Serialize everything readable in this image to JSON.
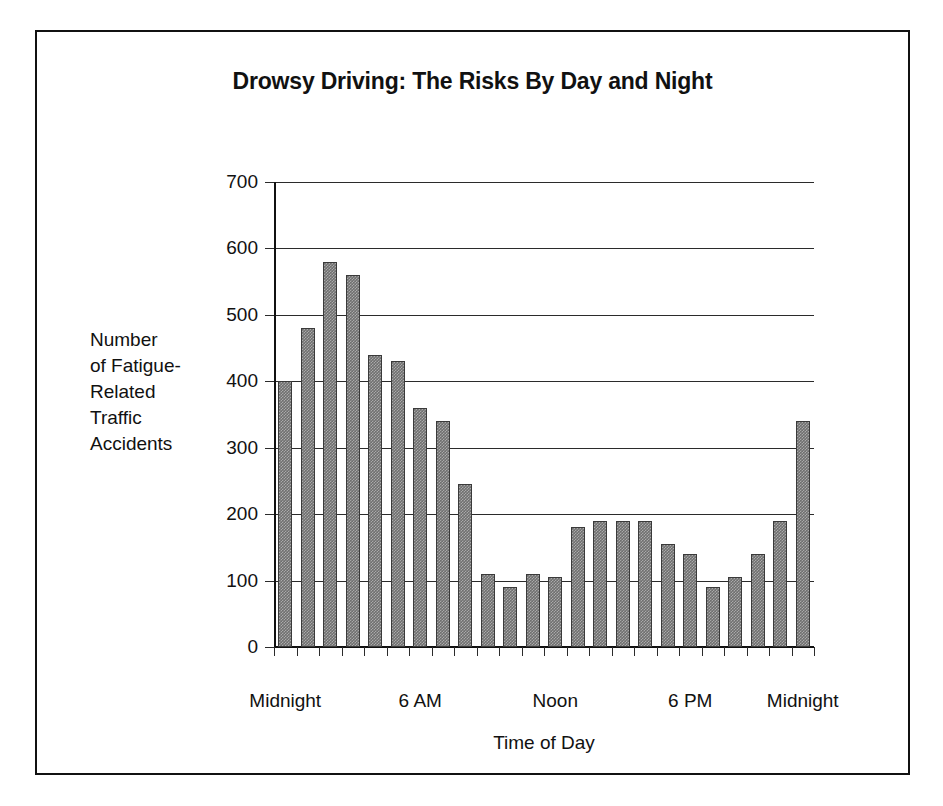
{
  "figure": {
    "title": "Drowsy Driving: The Risks By Day and Night",
    "frame_color": "#111111",
    "background": "#ffffff",
    "bar_color": "#6f6f6f",
    "bar_border_color": "#3a3a3a"
  },
  "chart_data": {
    "type": "bar",
    "title": "Drowsy Driving: The Risks By Day and Night",
    "xlabel": "Time of Day",
    "ylabel": "Number of Fatigue-Related Traffic Accidents",
    "ylabel_lines": [
      "Number",
      "of Fatigue-",
      "Related",
      "Traffic",
      "Accidents"
    ],
    "ylim": [
      0,
      700
    ],
    "ytick_values": [
      0,
      100,
      200,
      300,
      400,
      500,
      600,
      700
    ],
    "ytick_labels": [
      "0",
      "100",
      "200",
      "300",
      "400",
      "500",
      "600",
      "700"
    ],
    "grid": true,
    "legend": "none",
    "categories": [
      "12 AM",
      "1 AM",
      "2 AM",
      "3 AM",
      "4 AM",
      "5 AM",
      "6 AM",
      "7 AM",
      "8 AM",
      "9 AM",
      "10 AM",
      "11 AM",
      "12 PM",
      "1 PM",
      "2 PM",
      "3 PM",
      "4 PM",
      "5 PM",
      "6 PM",
      "7 PM",
      "8 PM",
      "9 PM",
      "10 PM",
      "11 PM"
    ],
    "values": [
      400,
      480,
      580,
      560,
      440,
      430,
      360,
      340,
      245,
      110,
      90,
      110,
      105,
      180,
      190,
      190,
      190,
      155,
      140,
      90,
      105,
      140,
      190,
      340
    ],
    "xtick_labels": [
      {
        "label": "Midnight",
        "index": 0
      },
      {
        "label": "6 AM",
        "index": 6
      },
      {
        "label": "Noon",
        "index": 12
      },
      {
        "label": "6 PM",
        "index": 18
      },
      {
        "label": "Midnight",
        "index": 23
      }
    ]
  }
}
